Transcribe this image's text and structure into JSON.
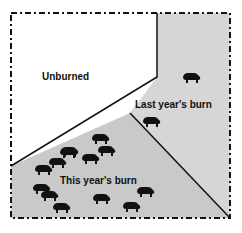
{
  "diagram": {
    "regions": [
      {
        "id": "unburned",
        "label": "Unburned",
        "fill": "#ffffff"
      },
      {
        "id": "last-year",
        "label": "Last year's burn",
        "fill": "#d6d6d6"
      },
      {
        "id": "this-year",
        "label": "This year's burn",
        "fill": "#c9c9c9"
      }
    ],
    "grazers": {
      "icon": "bison-icon",
      "last_year_count": 2,
      "this_year_count": 15
    },
    "border_style": "dash-dot",
    "line_color": "#111111"
  }
}
